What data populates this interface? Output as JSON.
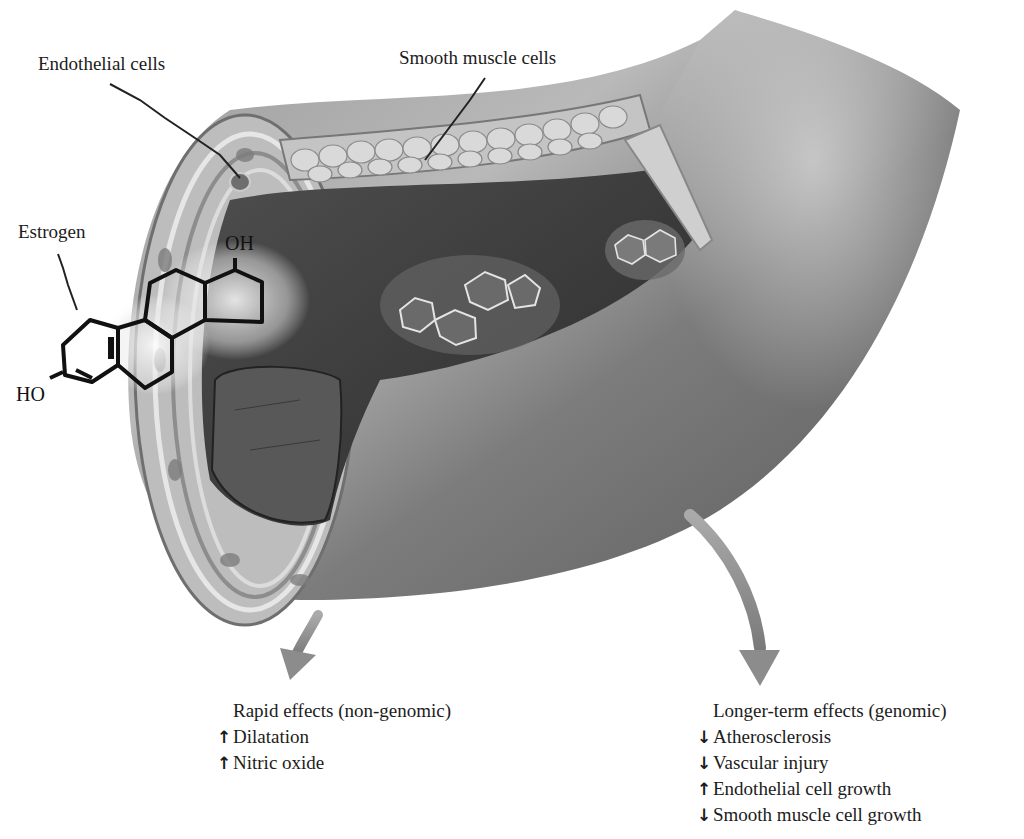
{
  "figure": {
    "colors": {
      "background": "#ffffff",
      "vessel_outer": "#8a8a8a",
      "vessel_dark": "#4a4a4a",
      "lumen": "#3c3c3c",
      "wall_layers": "#c8c8c8",
      "arrow": "#8c8c8c",
      "text": "#1c1c1c"
    }
  },
  "labels": {
    "endothelial": "Endothelial cells",
    "smooth_muscle": "Smooth muscle cells",
    "estrogen": "Estrogen"
  },
  "molecule": {
    "oh": "OH",
    "ho": "HO"
  },
  "rapid_effects": {
    "heading": "Rapid effects (non-genomic)",
    "items": [
      {
        "arrow": "↑",
        "direction": "up",
        "text": "Dilatation"
      },
      {
        "arrow": "↑",
        "direction": "up",
        "text": "Nitric oxide"
      }
    ]
  },
  "longer_effects": {
    "heading": "Longer-term effects (genomic)",
    "items": [
      {
        "arrow": "↓",
        "direction": "down",
        "text": "Atherosclerosis"
      },
      {
        "arrow": "↓",
        "direction": "down",
        "text": "Vascular injury"
      },
      {
        "arrow": "↑",
        "direction": "up",
        "text": "Endothelial cell growth"
      },
      {
        "arrow": "↓",
        "direction": "down",
        "text": "Smooth muscle cell growth"
      }
    ]
  }
}
